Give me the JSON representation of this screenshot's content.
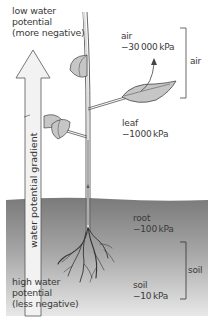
{
  "diagram": {
    "top_label": {
      "line1": "low water",
      "line2": "potential",
      "line3": "(more negative)"
    },
    "bottom_label": {
      "line1": "high water",
      "line2": "potential",
      "line3": "(less negative)"
    },
    "arrow_label": "water potential gradient",
    "points": [
      {
        "name": "air",
        "value": "−30 000 kPa"
      },
      {
        "name": "leaf",
        "value": "−1000 kPa"
      },
      {
        "name": "root",
        "value": "−100 kPa"
      },
      {
        "name": "soil",
        "value": "−10 kPa"
      }
    ],
    "brackets": [
      {
        "label": "air"
      },
      {
        "label": "soil"
      }
    ],
    "colors": {
      "soil_top": "#7d7d7d",
      "soil_bottom": "#e6e6e6",
      "leaf_fill": "#c8c8c8",
      "arrow_fill": "#f4f4f4",
      "line": "#444444"
    }
  }
}
